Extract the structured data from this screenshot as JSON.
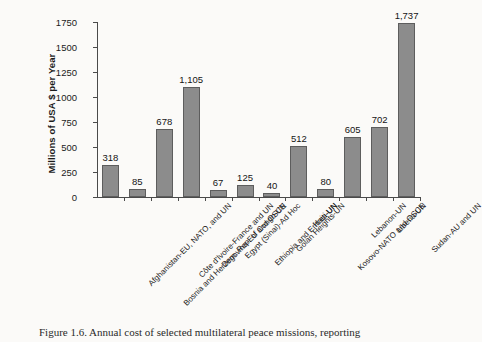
{
  "chart_data": {
    "type": "bar",
    "title": "",
    "xlabel": "",
    "ylabel": "Millions of USA $ per Year",
    "ylim": [
      0,
      1750
    ],
    "yticks": [
      0,
      250,
      500,
      750,
      1000,
      1250,
      1500,
      1750
    ],
    "ytick_labels": [
      "0",
      "250",
      "500",
      "750",
      "1000",
      "1250",
      "1500",
      "1750"
    ],
    "grid": false,
    "legend": "none",
    "bar_color": "#8c8c8c",
    "bar_edge_color": "#5d5d5d",
    "categories": [
      "Afghanistan-EU, NATO, and UN",
      "Bosnia and Herzegovina-EU and OSCE",
      "Côte d'Ivoire-France and UN",
      "Dem. Rep. of Congo-UN",
      "Egypt (Sinai)-Ad Hoc",
      "Ethiopia and Eritrea-UN",
      "Golan Heights-UN",
      "Haiti-UN",
      "Kosovo-NATO and OSCE",
      "Lebanon-UN",
      "Liberia-UN",
      "Sudan-AU and UN"
    ],
    "values": [
      318,
      85,
      678,
      1105,
      67,
      125,
      40,
      512,
      80,
      605,
      702,
      1737
    ],
    "value_labels": [
      "318",
      "85",
      "678",
      "1,105",
      "67",
      "125",
      "40",
      "512",
      "80",
      "605",
      "702",
      "1,737"
    ]
  },
  "caption": {
    "text": "Figure 1.6.  Annual cost of selected multilateral peace missions, reporting"
  }
}
